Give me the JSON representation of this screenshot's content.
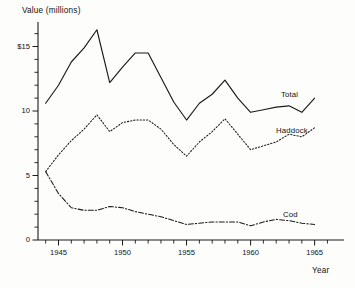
{
  "chart_data": {
    "type": "line",
    "title": "",
    "xlabel": "Year",
    "ylabel": "Value (millions)",
    "xlim": [
      1943.4,
      1966.2
    ],
    "ylim": [
      0,
      16.9
    ],
    "grid": false,
    "legend_position": "inline-right-of-line-ends",
    "x_tick_labels": [
      "1945",
      "1950",
      "1955",
      "1960",
      "1965"
    ],
    "x_tick_values": [
      1945,
      1950,
      1955,
      1960,
      1965
    ],
    "x_minor_tick_values": [
      1944,
      1946,
      1947,
      1948,
      1949,
      1951,
      1952,
      1953,
      1954,
      1956,
      1957,
      1958,
      1959,
      1961,
      1962,
      1963,
      1964,
      1966
    ],
    "y_tick_labels": [
      "0",
      "5",
      "10",
      "$15"
    ],
    "y_tick_values": [
      0,
      5,
      10,
      15
    ],
    "y_minor_tick_values": [
      1,
      2,
      3,
      4,
      6,
      7,
      8,
      9,
      11,
      12,
      13,
      14,
      16
    ],
    "x": [
      1944,
      1945,
      1946,
      1947,
      1948,
      1949,
      1950,
      1951,
      1952,
      1953,
      1954,
      1955,
      1956,
      1957,
      1958,
      1959,
      1960,
      1961,
      1962,
      1963,
      1964,
      1965
    ],
    "series": [
      {
        "name": "Total",
        "style": "solid",
        "color": "#1a1a1a",
        "values": [
          10.6,
          12.0,
          13.8,
          14.9,
          16.3,
          12.2,
          13.4,
          14.5,
          14.5,
          12.6,
          10.7,
          9.3,
          10.6,
          11.3,
          12.4,
          11.0,
          9.9,
          10.1,
          10.3,
          10.4,
          9.9,
          11.0
        ]
      },
      {
        "name": "Haddock",
        "style": "dotted",
        "color": "#1a1a1a",
        "values": [
          5.3,
          6.6,
          7.7,
          8.6,
          9.7,
          8.4,
          9.1,
          9.3,
          9.3,
          8.6,
          7.4,
          6.5,
          7.6,
          8.4,
          9.4,
          8.2,
          7.0,
          7.3,
          7.6,
          8.2,
          8.0,
          8.7
        ]
      },
      {
        "name": "Cod",
        "style": "dashdot",
        "color": "#1a1a1a",
        "values": [
          5.3,
          3.6,
          2.5,
          2.3,
          2.3,
          2.6,
          2.5,
          2.2,
          2.0,
          1.8,
          1.5,
          1.2,
          1.3,
          1.4,
          1.4,
          1.4,
          1.1,
          1.4,
          1.6,
          1.5,
          1.3,
          1.2
        ]
      }
    ],
    "series_label_positions": [
      {
        "name": "Total",
        "x_px": 281,
        "y_px": 90
      },
      {
        "name": "Haddock",
        "x_px": 276,
        "y_px": 126
      },
      {
        "name": "Cod",
        "x_px": 283,
        "y_px": 210
      }
    ]
  }
}
